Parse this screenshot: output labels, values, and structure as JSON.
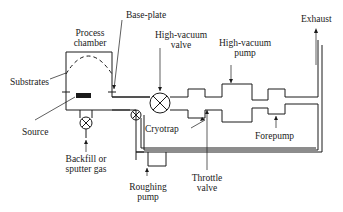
{
  "diagram": {
    "type": "vacuum-system-schematic",
    "labels": {
      "process_chamber": [
        "Process",
        "chamber"
      ],
      "base_plate": "Base-plate",
      "substrates": "Substrates",
      "source": "Source",
      "high_vacuum_valve": [
        "High-vacuum",
        "valve"
      ],
      "high_vacuum_pump": [
        "High-vacuum",
        "pump"
      ],
      "exhaust": "Exhaust",
      "cryotrap": "Cryotrap",
      "forepump": "Forepump",
      "backfill": [
        "Backfill or",
        "sputter gas"
      ],
      "throttle_valve": [
        "Throttle",
        "valve"
      ],
      "roughing_pump": [
        "Roughing",
        "pump"
      ]
    },
    "colors": {
      "line": "#1a1a1a",
      "background": "#ffffff"
    }
  }
}
